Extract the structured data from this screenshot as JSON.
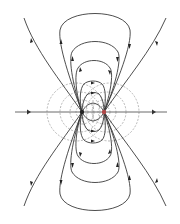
{
  "diagram": {
    "type": "electric-dipole-field-lines",
    "width": 180,
    "height": 224,
    "colors": {
      "background": "#ffffff",
      "field_line": "#3a3a3a",
      "equipotential": "#9a9a9a",
      "axis": "#6a6a6a",
      "negative_charge": "#222222",
      "positive_charge": "#b04848"
    },
    "axis_y": 112,
    "axis_x_range": [
      15,
      167
    ],
    "charges": [
      {
        "name": "left-charge",
        "x": 82,
        "y": 112
      },
      {
        "name": "right-charge",
        "x": 104,
        "y": 112
      }
    ],
    "labels": []
  }
}
